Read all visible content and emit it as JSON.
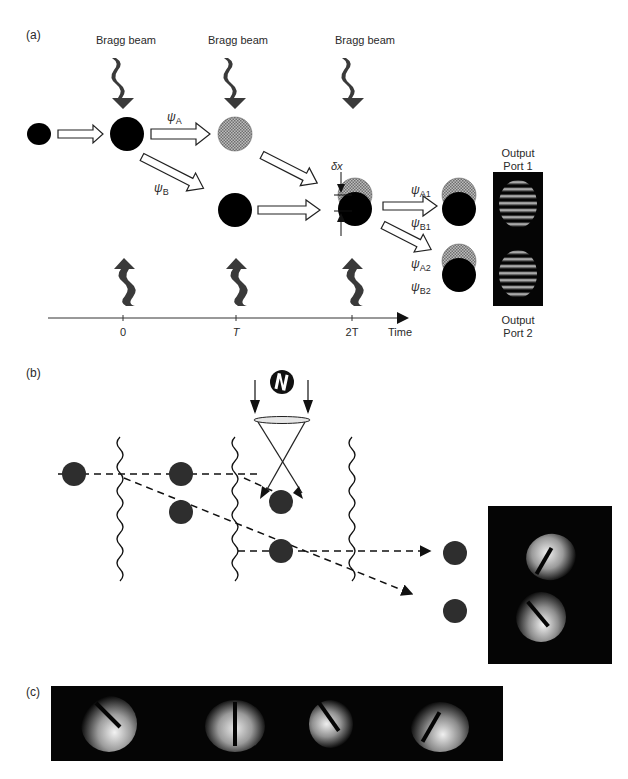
{
  "figure": {
    "panel_a": {
      "label": "(a)",
      "bragg_beams": [
        {
          "label": "Bragg beam",
          "x": 120
        },
        {
          "label": "Bragg beam",
          "x": 232
        },
        {
          "label": "Bragg beam",
          "x": 350
        }
      ],
      "wavefunctions": {
        "psi_A": {
          "symbol": "ψ",
          "sub": "A"
        },
        "psi_B": {
          "symbol": "ψ",
          "sub": "B"
        },
        "psi_A1": {
          "symbol": "ψ",
          "sub": "A1"
        },
        "psi_B1": {
          "symbol": "ψ",
          "sub": "B1"
        },
        "psi_A2": {
          "symbol": "ψ",
          "sub": "A2"
        },
        "psi_B2": {
          "symbol": "ψ",
          "sub": "B2"
        }
      },
      "delta_x_label": "δx",
      "output_port_1": {
        "line1": "Output",
        "line2": "Port 1"
      },
      "output_port_2": {
        "line1": "Output",
        "line2": "Port 2"
      },
      "time_axis": {
        "ticks": [
          {
            "label": "0",
            "x": 123
          },
          {
            "label": "T",
            "x": 236
          },
          {
            "label": "2T",
            "x": 352
          }
        ],
        "axis_label": "Time"
      }
    },
    "panel_b": {
      "label": "(b)",
      "icon": "mirror-N-glyph"
    },
    "panel_c": {
      "label": "(c)",
      "frames": 4
    },
    "colors": {
      "atom_dark": "#000000",
      "atom_b": "#2e2e2e",
      "hatched": "#9a9a9a",
      "image_bg": "#050505",
      "fringe": "#e8e8e8"
    }
  }
}
